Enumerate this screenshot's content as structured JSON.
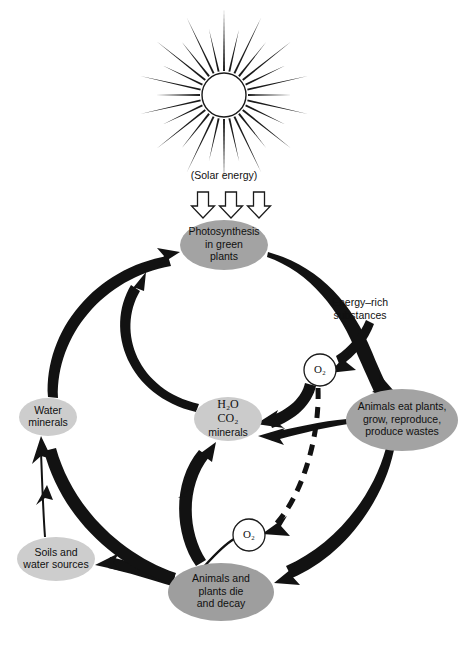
{
  "diagram": {
    "width": 472,
    "height": 646,
    "background": "#ffffff"
  },
  "sun": {
    "name": "sun-icon",
    "center_x": 224,
    "center_y": 95,
    "disc_radius": 22,
    "ray_count": 28,
    "ray_length_long": 62,
    "ray_length_short": 44,
    "color": "#1a1a1a"
  },
  "solar_energy": {
    "label": "(Solar energy)",
    "x": 224,
    "y": 176,
    "arrows": [
      {
        "name": "solar-arrow-left",
        "x": 203
      },
      {
        "name": "solar-arrow-center",
        "x": 231
      },
      {
        "name": "solar-arrow-right",
        "x": 259
      }
    ],
    "arrow_top": 192,
    "arrow_bottom": 218
  },
  "nodes": [
    {
      "id": "photosynthesis",
      "name": "node-photosynthesis",
      "lines": [
        "Photosynthesis",
        "in green",
        "plants"
      ],
      "cx": 224,
      "cy": 245,
      "rx": 44,
      "ry": 25,
      "fill": "#a3a3a3"
    },
    {
      "id": "animals_eat",
      "name": "node-animals-eat-plants",
      "lines": [
        "Animals eat plants,",
        "grow, reproduce,",
        "produce wastes"
      ],
      "cx": 402,
      "cy": 420,
      "rx": 56,
      "ry": 31,
      "fill": "#a3a3a3"
    },
    {
      "id": "water_co2_minerals",
      "name": "node-h2o-co2-minerals",
      "lines": [
        "H₂O",
        "CO₂",
        "minerals"
      ],
      "cx": 228,
      "cy": 419,
      "rx": 34,
      "ry": 22,
      "fill": "#cbcbcb"
    },
    {
      "id": "water_minerals",
      "name": "node-water-minerals",
      "lines": [
        "Water",
        "minerals"
      ],
      "cx": 48,
      "cy": 417,
      "rx": 29,
      "ry": 19,
      "fill": "#cdcdcd"
    },
    {
      "id": "soils_water",
      "name": "node-soils-and-water-sources",
      "lines": [
        "Soils and",
        "water sources"
      ],
      "cx": 56,
      "cy": 559,
      "rx": 39,
      "ry": 22,
      "fill": "#cdcdcd"
    },
    {
      "id": "die_decay",
      "name": "node-animals-and-plants-die-and-decay",
      "lines": [
        "Animals and",
        "plants die",
        "and decay"
      ],
      "cx": 221,
      "cy": 592,
      "rx": 53,
      "ry": 29,
      "fill": "#9e9e9e"
    }
  ],
  "oxygen_markers": [
    {
      "id": "o2_upper",
      "name": "o2-marker-upper",
      "label": "O₂",
      "cx": 320,
      "cy": 370,
      "r": 16
    },
    {
      "id": "o2_lower",
      "name": "o2-marker-lower",
      "label": "O₂",
      "cx": 249,
      "cy": 535,
      "r": 16
    }
  ],
  "free_labels": [
    {
      "id": "energy_rich",
      "name": "label-energy-rich-substances",
      "lines": [
        "Energy–rich",
        "substances"
      ],
      "x": 360,
      "y": 303
    }
  ],
  "flows": [
    {
      "id": "f1",
      "name": "flow-water-minerals-to-photosynthesis",
      "from": "water_minerals",
      "to": "photosynthesis",
      "style": "thick"
    },
    {
      "id": "f2",
      "name": "flow-h2o-co2-to-photosynthesis",
      "from": "water_co2_minerals",
      "to": "photosynthesis",
      "style": "thick"
    },
    {
      "id": "f3",
      "name": "flow-photosynthesis-to-animals-eat",
      "from": "photosynthesis",
      "to": "animals_eat",
      "style": "tapered"
    },
    {
      "id": "f4",
      "name": "flow-photosynthesis-to-o2-upper",
      "from": "photosynthesis",
      "to": "o2_upper",
      "style": "tapered"
    },
    {
      "id": "f5",
      "name": "flow-animals-eat-to-h2o-co2",
      "from": "animals_eat",
      "to": "water_co2_minerals",
      "style": "tapered"
    },
    {
      "id": "f6",
      "name": "flow-o2-upper-to-h2o-co2",
      "from": "o2_upper",
      "to": "water_co2_minerals",
      "style": "thick"
    },
    {
      "id": "f7",
      "name": "flow-animals-eat-to-die-decay",
      "from": "animals_eat",
      "to": "die_decay",
      "style": "tapered"
    },
    {
      "id": "f8",
      "name": "flow-die-decay-to-h2o-co2",
      "from": "die_decay",
      "to": "water_co2_minerals",
      "style": "thick"
    },
    {
      "id": "f9",
      "name": "flow-die-decay-to-o2-lower",
      "from": "die_decay",
      "to": "o2_lower",
      "style": "thin"
    },
    {
      "id": "f10",
      "name": "flow-die-decay-to-soils-water",
      "from": "die_decay",
      "to": "soils_water",
      "style": "thick"
    },
    {
      "id": "f11",
      "name": "flow-die-decay-to-water-minerals",
      "from": "die_decay",
      "to": "water_minerals",
      "style": "thick"
    },
    {
      "id": "f12",
      "name": "flow-soils-water-to-water-minerals",
      "from": "soils_water",
      "to": "water_minerals",
      "style": "thin"
    },
    {
      "id": "f13",
      "name": "flow-o2-upper-to-o2-lower-dashed",
      "from": "o2_upper",
      "to": "o2_lower",
      "style": "dashed"
    }
  ]
}
